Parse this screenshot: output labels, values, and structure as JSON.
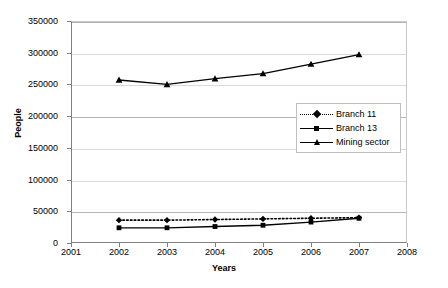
{
  "chart_data": {
    "type": "line",
    "title": "",
    "xlabel": "Years",
    "ylabel": "People",
    "x": [
      2002,
      2003,
      2004,
      2005,
      2006,
      2007
    ],
    "xlim": [
      2001,
      2008
    ],
    "ylim": [
      0,
      350000
    ],
    "xticks": [
      "2001",
      "2002",
      "2003",
      "2004",
      "2005",
      "2006",
      "2007",
      "2008"
    ],
    "yticks": [
      "0",
      "50000",
      "100000",
      "150000",
      "200000",
      "250000",
      "300000",
      "350000"
    ],
    "grid": "horizontal",
    "legend_position": "center-right",
    "series": [
      {
        "name": "Branch 11",
        "marker": "diamond",
        "line": "dotted",
        "color": "#000000",
        "values": [
          36000,
          36000,
          37000,
          38000,
          39000,
          40000
        ]
      },
      {
        "name": "Branch 13",
        "marker": "square",
        "line": "solid",
        "color": "#000000",
        "values": [
          24000,
          24000,
          26000,
          28000,
          33000,
          39000
        ]
      },
      {
        "name": "Mining sector",
        "marker": "triangle",
        "line": "solid",
        "color": "#000000",
        "values": [
          257000,
          250000,
          259000,
          267000,
          282000,
          297000
        ]
      }
    ]
  },
  "axis": {
    "y_title": "People",
    "x_title": "Years"
  },
  "legend": {
    "items": [
      {
        "label": "Branch 11"
      },
      {
        "label": "Branch 13"
      },
      {
        "label": "Mining sector"
      }
    ]
  }
}
